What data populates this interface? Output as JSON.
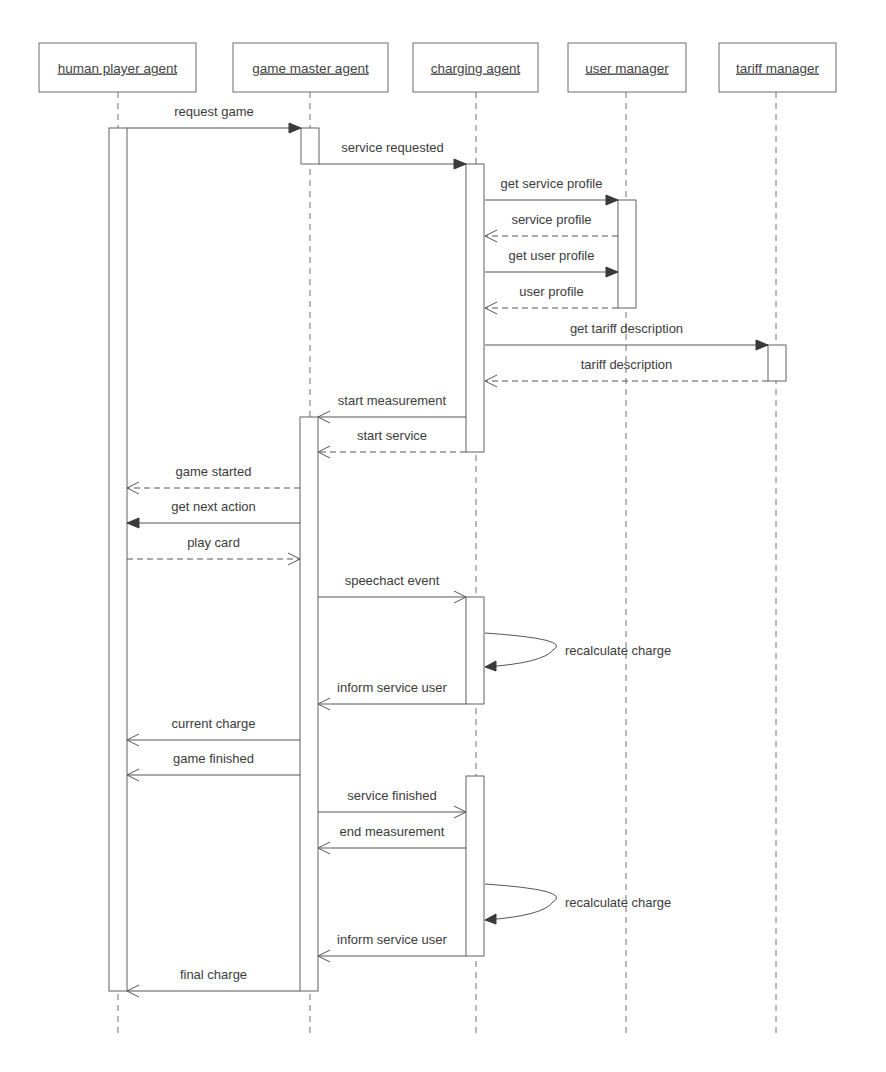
{
  "diagram": {
    "type": "UML sequence diagram",
    "colors": {
      "line": "#555555",
      "text": "#3c3c3c",
      "background": "#ffffff"
    },
    "participants": [
      {
        "id": "human",
        "label": "human player agent",
        "x": 118,
        "box": [
          39,
          43,
          157,
          49
        ]
      },
      {
        "id": "gm",
        "label": "game master agent",
        "x": 310,
        "box": [
          233,
          43,
          155,
          49
        ]
      },
      {
        "id": "charging",
        "label": "charging agent",
        "x": 476,
        "box": [
          413,
          43,
          125,
          49
        ]
      },
      {
        "id": "user",
        "label": "user manager",
        "x": 626,
        "box": [
          568,
          43,
          118,
          49
        ]
      },
      {
        "id": "tariff",
        "label": "tariff manager",
        "x": 776,
        "box": [
          719,
          43,
          117,
          49
        ]
      }
    ],
    "lifeline_end_y": 1035,
    "activations": [
      {
        "participant": "human",
        "x": 109,
        "y1": 128,
        "y2": 991
      },
      {
        "participant": "gm",
        "x": 301,
        "y1": 128,
        "y2": 164
      },
      {
        "participant": "charging",
        "x": 466,
        "y1": 164,
        "y2": 452
      },
      {
        "participant": "user",
        "x": 618,
        "y1": 200,
        "y2": 308
      },
      {
        "participant": "tariff",
        "x": 768,
        "y1": 345,
        "y2": 381
      },
      {
        "participant": "gm",
        "x": 300,
        "y1": 417,
        "y2": 991
      },
      {
        "participant": "charging",
        "x": 466,
        "y1": 597,
        "y2": 704
      },
      {
        "participant": "charging",
        "x": 466,
        "y1": 776,
        "y2": 956
      }
    ],
    "messages": [
      {
        "label": "request game",
        "from_x": 127,
        "to_x": 301,
        "y": 128,
        "style": "solid",
        "head": "filled"
      },
      {
        "label": "service requested",
        "from_x": 319,
        "to_x": 466,
        "y": 164,
        "style": "solid",
        "head": "filled"
      },
      {
        "label": "get service profile",
        "from_x": 485,
        "to_x": 618,
        "y": 200,
        "style": "solid",
        "head": "filled"
      },
      {
        "label": "service profile",
        "from_x": 618,
        "to_x": 485,
        "y": 236,
        "style": "dashed",
        "head": "open"
      },
      {
        "label": "get user profile",
        "from_x": 485,
        "to_x": 618,
        "y": 272,
        "style": "solid",
        "head": "filled"
      },
      {
        "label": "user profile",
        "from_x": 618,
        "to_x": 485,
        "y": 308,
        "style": "dashed",
        "head": "open"
      },
      {
        "label": "get tariff description",
        "from_x": 485,
        "to_x": 768,
        "y": 345,
        "style": "solid",
        "head": "filled"
      },
      {
        "label": "tariff description",
        "from_x": 768,
        "to_x": 485,
        "y": 381,
        "style": "dashed",
        "head": "open"
      },
      {
        "label": "start measurement",
        "from_x": 466,
        "to_x": 318,
        "y": 417,
        "style": "solid",
        "head": "open"
      },
      {
        "label": "start service",
        "from_x": 466,
        "to_x": 318,
        "y": 452,
        "style": "dashed",
        "head": "open"
      },
      {
        "label": "game started",
        "from_x": 300,
        "to_x": 127,
        "y": 488,
        "style": "dashed",
        "head": "open"
      },
      {
        "label": "get next action",
        "from_x": 300,
        "to_x": 127,
        "y": 523,
        "style": "solid",
        "head": "filled"
      },
      {
        "label": "play card",
        "from_x": 127,
        "to_x": 300,
        "y": 559,
        "style": "dashed",
        "head": "open"
      },
      {
        "label": "speechact event",
        "from_x": 318,
        "to_x": 466,
        "y": 597,
        "style": "solid",
        "head": "open"
      },
      {
        "label": "inform service user",
        "from_x": 466,
        "to_x": 318,
        "y": 704,
        "style": "solid",
        "head": "open"
      },
      {
        "label": "current charge",
        "from_x": 300,
        "to_x": 127,
        "y": 740,
        "style": "solid",
        "head": "open"
      },
      {
        "label": "game finished",
        "from_x": 300,
        "to_x": 127,
        "y": 775,
        "style": "solid",
        "head": "open"
      },
      {
        "label": "service finished",
        "from_x": 318,
        "to_x": 466,
        "y": 812,
        "style": "solid",
        "head": "open"
      },
      {
        "label": "end measurement",
        "from_x": 466,
        "to_x": 318,
        "y": 848,
        "style": "solid",
        "head": "open"
      },
      {
        "label": "inform service user",
        "from_x": 466,
        "to_x": 318,
        "y": 956,
        "style": "solid",
        "head": "open"
      },
      {
        "label": "final charge",
        "from_x": 300,
        "to_x": 127,
        "y": 991,
        "style": "solid",
        "head": "open"
      }
    ],
    "self_messages": [
      {
        "label": "recalculate charge",
        "x": 485,
        "y1": 633,
        "y2": 667,
        "bulge_x": 553,
        "label_x": 565
      },
      {
        "label": "recalculate charge",
        "x": 485,
        "y1": 884,
        "y2": 920,
        "bulge_x": 553,
        "label_x": 565
      }
    ]
  }
}
